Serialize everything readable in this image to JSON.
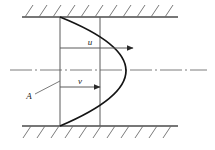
{
  "figure": {
    "background_color": "#ffffff",
    "line_color": "#3c3c3c",
    "curve_color": "#111111",
    "label_color": "#1a1a1a",
    "width": 215,
    "height": 150
  },
  "labels": {
    "velocity_profile_u": "u",
    "mean_velocity_v": "v",
    "area_marker_A": "A"
  },
  "geometry": {
    "top_wall": {
      "x1": 22,
      "y": 17,
      "x2": 178
    },
    "bottom_wall": {
      "x1": 22,
      "y": 126,
      "x2": 178
    },
    "center_axis": {
      "x1": 10,
      "y": 70,
      "x2": 207
    },
    "inlet_line": {
      "x": 60,
      "y1": 17,
      "y2": 126
    },
    "section_line": {
      "x": 100,
      "y1": 17,
      "y2": 126
    },
    "parabola": {
      "x_wall": 60,
      "x_vertex": 146,
      "y_top": 17,
      "y_bottom": 126,
      "y_vertex": 70
    },
    "arrow_u": {
      "x1": 60,
      "y": 48,
      "x2": 134
    },
    "arrow_v": {
      "x1": 60,
      "y": 87,
      "x2": 101
    },
    "leader_A": {
      "x1": 34,
      "y1": 93,
      "x2": 60,
      "y2": 82
    },
    "hatch_count_top": 11,
    "hatch_count_bottom": 11
  }
}
